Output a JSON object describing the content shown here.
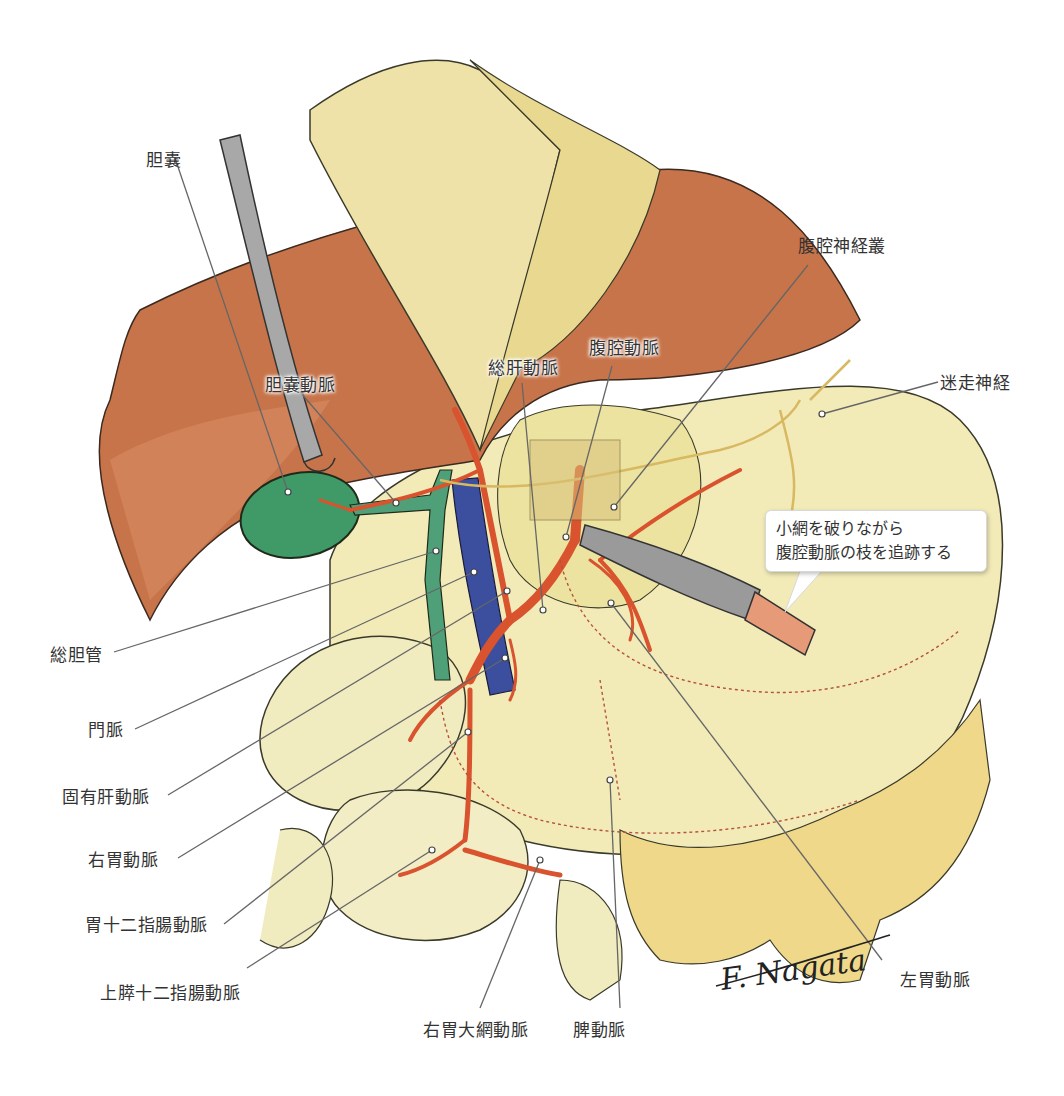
{
  "figure": {
    "type": "anatomical illustration",
    "background": "#ffffff",
    "colors": {
      "liver": "#c8744a",
      "gallbladder": "#3f9a68",
      "bile_duct": "#4fa078",
      "portal_vein": "#3c4f9e",
      "artery": "#d8532e",
      "stomach": "#f2ebb8",
      "retractor": "#a8a8a8",
      "knife_blade": "#9a9a9a",
      "knife_handle": "#e69a78",
      "nerve": "#d8b860",
      "label_text": "#333333",
      "leader_line": "#666666"
    },
    "signature": "F. Nagata"
  },
  "labels": {
    "gallbladder": "胆嚢",
    "cystic_artery": "胆嚢動脈",
    "common_hepatic_artery": "総肝動脈",
    "celiac_artery": "腹腔動脈",
    "celiac_plexus": "腹腔神経叢",
    "vagus_nerve": "迷走神経",
    "common_bile_duct": "総胆管",
    "portal_vein": "門脈",
    "proper_hepatic_artery": "固有肝動脈",
    "right_gastric_artery": "右胃動脈",
    "gastroduodenal_artery": "胃十二指腸動脈",
    "superior_pancreaticoduodenal_artery": "上膵十二指腸動脈",
    "right_gastroepiploic_artery": "右胃大網動脈",
    "splenic_artery": "脾動脈",
    "left_gastric_artery": "左胃動脈"
  },
  "callout": {
    "line1": "小網を破りながら",
    "line2": "腹腔動脈の枝を追跡する"
  }
}
